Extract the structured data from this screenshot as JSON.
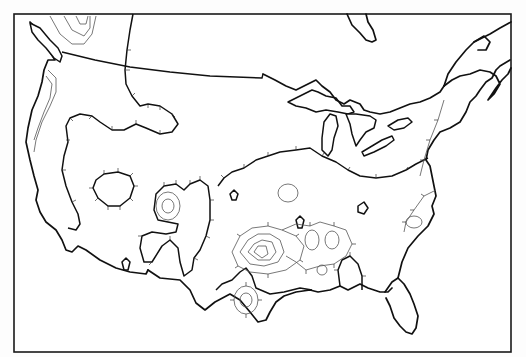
{
  "figure": {
    "type": "isopleth-contour-map",
    "region": "contiguous-united-states",
    "style": "monochrome line drawing with hachured contours",
    "colors": {
      "background": "#ffffff",
      "lines": "#111111",
      "isolines": "#555555"
    }
  },
  "map": {
    "frame": {
      "x": 14,
      "y": 13,
      "width": 498,
      "height": 339
    },
    "layers": [
      {
        "name": "coastline-and-borders",
        "kind": "base-map"
      },
      {
        "name": "great-lakes",
        "kind": "base-map"
      },
      {
        "name": "zero-contour",
        "kind": "bold-hachured-isoline"
      },
      {
        "name": "secondary-contours",
        "kind": "thin-hachured-isolines"
      }
    ],
    "features": [
      "pacific-northwest-closed-contours",
      "nevada-closed-oval",
      "four-corners-local-minimum",
      "texas-oklahoma-concentric-maximum",
      "gulf-coast-lobe",
      "southeast-atlantic-lobe"
    ]
  }
}
